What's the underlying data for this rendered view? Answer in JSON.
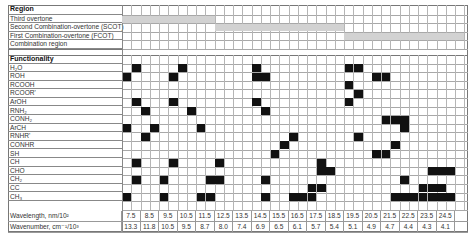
{
  "chart_data": {
    "type": "heatmap",
    "title": "",
    "sections": {
      "region_header": "Region",
      "functionality_header": "Functionality"
    },
    "regions": [
      {
        "label": "Third overtone",
        "span_cols": [
          0,
          10
        ]
      },
      {
        "label": "Second Combination-overtone (SCOT)",
        "span_cols": [
          10,
          24
        ]
      },
      {
        "label": "First Combination-overtone (FCOT)",
        "span_cols": [
          24,
          37
        ]
      },
      {
        "label": "Combination region",
        "span_cols": []
      }
    ],
    "functional_groups": [
      {
        "label": "H2O",
        "display": "H₂O",
        "cells": [
          1,
          6,
          14,
          24,
          25
        ]
      },
      {
        "label": "ROH",
        "display": "ROH",
        "cells": [
          0,
          5,
          14,
          15,
          27,
          28
        ]
      },
      {
        "label": "RCOOH",
        "display": "RCOOH",
        "cells": [
          24
        ]
      },
      {
        "label": "RCOOR'",
        "display": "RCOOR'",
        "cells": [
          25
        ]
      },
      {
        "label": "ArOH",
        "display": "ArOH",
        "cells": [
          1,
          5,
          14,
          24
        ]
      },
      {
        "label": "RNH2",
        "display": "RNH₂",
        "cells": [
          2,
          7,
          15
        ]
      },
      {
        "label": "CONH2",
        "display": "CONH₂",
        "cells": [
          28,
          29,
          30
        ]
      },
      {
        "label": "ArCH",
        "display": "ArCH",
        "cells": [
          0,
          3,
          8,
          30
        ]
      },
      {
        "label": "RNHR'",
        "display": "RNHR'",
        "cells": [
          2,
          18,
          25
        ]
      },
      {
        "label": "CONHR",
        "display": "CONHR",
        "cells": [
          17,
          29
        ]
      },
      {
        "label": "SH",
        "display": "SH",
        "cells": [
          16,
          27,
          28
        ]
      },
      {
        "label": "CH",
        "display": "CH",
        "cells": [
          1,
          5,
          10,
          21
        ]
      },
      {
        "label": "CHO",
        "display": "CHO",
        "cells": [
          21,
          22,
          33,
          34,
          35
        ]
      },
      {
        "label": "CH2",
        "display": "CH₂",
        "cells": [
          1,
          4,
          9,
          10,
          15,
          30
        ]
      },
      {
        "label": "CC",
        "display": "CC",
        "cells": [
          20,
          21,
          32,
          33,
          34
        ]
      },
      {
        "label": "CH3",
        "display": "CH₃",
        "cells": [
          0,
          4,
          8,
          9,
          15,
          18,
          19,
          20,
          29,
          30,
          31,
          32,
          33,
          34,
          35
        ]
      }
    ],
    "xlabel_rows": [
      {
        "label": "Wavelength, nm/10²",
        "values": [
          "7.5",
          "8.5",
          "9.5",
          "10.5",
          "11.5",
          "12.5",
          "13.5",
          "14.5",
          "15.5",
          "16.5",
          "17.5",
          "18.5",
          "19.5",
          "20.5",
          "21.5",
          "22.5",
          "23.5",
          "24.5"
        ]
      },
      {
        "label": "Wavenumber, cm⁻¹/10³",
        "values": [
          "13.3",
          "11.8",
          "10.5",
          "9.5",
          "8.7",
          "8.0",
          "7.4",
          "6.9",
          "6.5",
          "6.1",
          "5.7",
          "5.4",
          "5.1",
          "4.9",
          "4.7",
          "4.4",
          "4.3",
          "4.1"
        ]
      }
    ],
    "grid_columns": 37,
    "colors": {
      "filled": "#111111",
      "region_band": "#d2d2d2",
      "grid": "#b5b5b5"
    }
  }
}
